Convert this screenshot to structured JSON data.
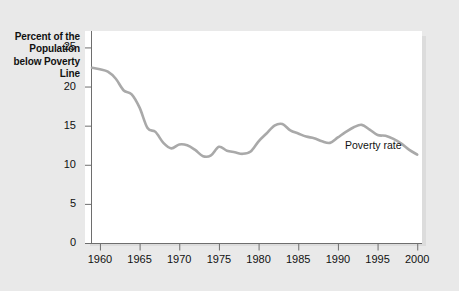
{
  "chart_data": {
    "type": "line",
    "title": "",
    "xlabel": "",
    "ylabel": "Percent of the Population below Poverty Line",
    "ylabel_lines": [
      "Percent of the",
      "Population",
      "below Poverty",
      "Line"
    ],
    "xlim": [
      1959,
      2000
    ],
    "ylim": [
      0,
      27
    ],
    "grid": false,
    "legend_position": "inline-annotation",
    "line_color": "#a9a9a9",
    "x_tick_labels": [
      "1960",
      "1965",
      "1970",
      "1975",
      "1980",
      "1985",
      "1990",
      "1995",
      "2000"
    ],
    "x_ticks": [
      1960,
      1965,
      1970,
      1975,
      1980,
      1985,
      1990,
      1995,
      2000
    ],
    "y_tick_labels": [
      "25",
      "20",
      "15",
      "10",
      "5",
      "0"
    ],
    "y_ticks": [
      25,
      20,
      15,
      10,
      5,
      0
    ],
    "series": [
      {
        "name": "Poverty rate",
        "annotation": "Poverty rate",
        "x": [
          1959,
          1960,
          1961,
          1962,
          1963,
          1964,
          1965,
          1966,
          1967,
          1968,
          1969,
          1970,
          1971,
          1972,
          1973,
          1974,
          1975,
          1976,
          1977,
          1978,
          1979,
          1980,
          1981,
          1982,
          1983,
          1984,
          1985,
          1986,
          1987,
          1988,
          1989,
          1990,
          1991,
          1992,
          1993,
          1994,
          1995,
          1996,
          1997,
          1998,
          1999,
          2000
        ],
        "values": [
          22.4,
          22.2,
          21.9,
          21.0,
          19.5,
          19.0,
          17.3,
          14.7,
          14.2,
          12.8,
          12.1,
          12.6,
          12.5,
          11.9,
          11.1,
          11.2,
          12.3,
          11.8,
          11.6,
          11.4,
          11.7,
          13.0,
          14.0,
          15.0,
          15.2,
          14.4,
          14.0,
          13.6,
          13.4,
          13.0,
          12.8,
          13.5,
          14.2,
          14.8,
          15.1,
          14.5,
          13.8,
          13.7,
          13.3,
          12.7,
          11.9,
          11.3
        ]
      }
    ]
  },
  "annotations": {
    "poverty_rate_label": "Poverty rate"
  }
}
